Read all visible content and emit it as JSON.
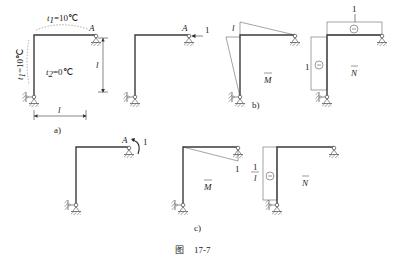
{
  "figure": {
    "caption_prefix": "图",
    "caption_number": "17-7"
  },
  "panel_a": {
    "label": "a)",
    "top_temp": "t₁=10℃",
    "top_temp_var": "t",
    "top_temp_sub": "1",
    "top_temp_val": "=10℃",
    "left_temp_var": "t",
    "left_temp_sub": "1",
    "left_temp_val": "=10℃",
    "inside_temp_var": "t",
    "inside_temp_sub": "2",
    "inside_temp_val": "=0℃",
    "node_A": "A",
    "height_dim": "l",
    "width_dim": "l"
  },
  "panel_a_unit": {
    "node_A": "A",
    "load": "1"
  },
  "panel_b": {
    "label": "b)",
    "moment_diagram": {
      "title": "M",
      "value_label": "l"
    },
    "axial_diagram": {
      "title": "N",
      "top_value": "1",
      "left_value": "1",
      "sign": "−"
    }
  },
  "panel_c": {
    "label": "c)",
    "node_A": "A",
    "moment_load": "1",
    "moment_diagram": {
      "title": "M",
      "value_label": "1"
    },
    "axial_diagram": {
      "title": "N",
      "left_value_num": "1",
      "left_value_den": "l",
      "sign": "−"
    }
  }
}
